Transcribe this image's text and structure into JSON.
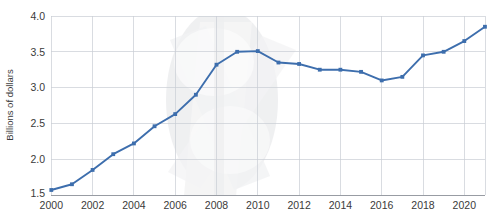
{
  "chart_data": {
    "type": "line",
    "title": "",
    "subtitle": "",
    "xlabel": "",
    "ylabel": "Billions of dollars",
    "x": [
      2000,
      2001,
      2002,
      2003,
      2004,
      2005,
      2006,
      2007,
      2008,
      2009,
      2010,
      2011,
      2012,
      2013,
      2014,
      2015,
      2016,
      2017,
      2018,
      2019,
      2020,
      2021
    ],
    "values": [
      1.57,
      1.65,
      1.85,
      2.07,
      2.22,
      2.46,
      2.63,
      2.9,
      3.32,
      3.5,
      3.51,
      3.35,
      3.33,
      3.25,
      3.25,
      3.22,
      3.1,
      3.15,
      3.45,
      3.5,
      3.65,
      3.85
    ],
    "series": [
      {
        "name": "Billions of dollars",
        "color": "#3d6ead",
        "values": [
          1.57,
          1.65,
          1.85,
          2.07,
          2.22,
          2.46,
          2.63,
          2.9,
          3.32,
          3.5,
          3.51,
          3.35,
          3.33,
          3.25,
          3.25,
          3.22,
          3.1,
          3.15,
          3.45,
          3.5,
          3.65,
          3.85
        ]
      }
    ],
    "xtick_labels": [
      "2000",
      "2002",
      "2004",
      "2006",
      "2008",
      "2010",
      "2012",
      "2014",
      "2016",
      "2018",
      "2020"
    ],
    "xtick_values": [
      2000,
      2002,
      2004,
      2006,
      2008,
      2010,
      2012,
      2014,
      2016,
      2018,
      2020
    ],
    "ytick_labels": [
      "1.5",
      "2.0",
      "2.5",
      "3.0",
      "3.5",
      "4.0"
    ],
    "ytick_values": [
      1.5,
      2.0,
      2.5,
      3.0,
      3.5,
      4.0
    ],
    "xlim": [
      1999.5,
      2021.5
    ],
    "ylim": [
      1.5,
      4.0
    ],
    "grid": true,
    "grid_color": "#c9cdd4",
    "legend": false,
    "legend_position": "none",
    "marker": "square",
    "background_color": "#ffffff",
    "watermark": "dollar-sign"
  },
  "axes": {
    "y_axis_title": "Billions of dollars"
  }
}
